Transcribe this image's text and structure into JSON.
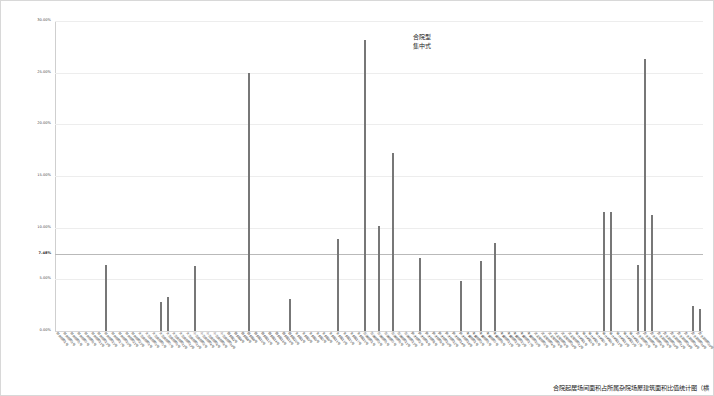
{
  "chart_data": {
    "type": "bar",
    "title": "",
    "xlabel": "",
    "ylabel": "",
    "ylim": [
      0,
      30
    ],
    "grid": true,
    "legend": null,
    "y_ticks": [
      {
        "value": 30,
        "label": "30.00%",
        "bold": false
      },
      {
        "value": 25,
        "label": "25.00%",
        "bold": false
      },
      {
        "value": 20,
        "label": "20.00%",
        "bold": false
      },
      {
        "value": 15,
        "label": "15.00%",
        "bold": false
      },
      {
        "value": 10,
        "label": "10.00%",
        "bold": false
      },
      {
        "value": 7.48,
        "label": "7.48%",
        "bold": true
      },
      {
        "value": 5,
        "label": "5.00%",
        "bold": false
      },
      {
        "value": 0,
        "label": "0.00%",
        "bold": false
      }
    ],
    "reference_line": {
      "value": 7.48,
      "label": "7.48%"
    },
    "annotations": [
      {
        "text_line1": "合院型",
        "text_line2": "集中式",
        "x_index": 40,
        "y": 29.5
      }
    ],
    "categories": [
      "前井胡同1号",
      "前井胡同3号",
      "前井胡同5号",
      "前井胡同7号",
      "前井胡同9号",
      "前井胡同11号",
      "前井胡同13号",
      "前井胡同15号",
      "前井胡同17号",
      "前井胡同19号",
      "前井胡同21号",
      "前井胡同23号",
      "大石虎胡同1号",
      "大石虎胡同3号",
      "大石虎胡同5号",
      "大石虎胡同7号",
      "大石虎胡同9号",
      "大石虎胡同11号",
      "大石虎胡同13号",
      "大石虎胡同15号",
      "小石虎胡同2号",
      "小石虎胡同4号",
      "小石虎胡同6号",
      "小石虎胡同8号",
      "小石虎胡同10号",
      "西斜街2号",
      "西斜街4号",
      "西斜街6号",
      "西斜街8号",
      "西斜街10号",
      "西斜街12号",
      "西斜街14号",
      "西斜街16号",
      "西斜街18号",
      "西斜街20号",
      "东斜街1号",
      "东斜街3号",
      "东斜街5号",
      "东斜街7号",
      "东斜街9号",
      "东斜街11号",
      "东斜街13号",
      "东斜街15号",
      "东斜街17号",
      "东斜街19号",
      "石碑胡同1号",
      "石碑胡同3号",
      "石碑胡同5号",
      "石碑胡同7号",
      "石碑胡同9号",
      "石碑胡同11号",
      "石碑胡同13号",
      "辟才胡同2号",
      "辟才胡同4号",
      "辟才胡同6号",
      "辟才胡同8号",
      "辟才胡同10号",
      "辟才胡同12号",
      "辟才胡同14号",
      "辟才胡同16号",
      "丰盛胡同1号",
      "丰盛胡同3号",
      "丰盛胡同5号",
      "丰盛胡同7号",
      "丰盛胡同9号",
      "丰盛胡同11号",
      "丰盛胡同13号",
      "丰盛胡同15号",
      "丰盛胡同17号",
      "丰盛胡同19号",
      "武定侯胡同2号",
      "武定侯胡同4号",
      "武定侯胡同6号",
      "武定侯胡同8号",
      "武定侯胡同10号",
      "武定侯胡同12号",
      "锦什坊街1号",
      "锦什坊街3号",
      "锦什坊街5号",
      "锦什坊街7号",
      "锦什坊街9号",
      "锦什坊街11号",
      "锦什坊街13号",
      "锦什坊街15号",
      "锦什坊街17号",
      "受水河胡同2号",
      "受水河胡同4号",
      "受水河胡同6号",
      "受水河胡同8号",
      "受水河胡同10号",
      "受水河胡同12号",
      "受水河胡同14号",
      "受水河胡同16号",
      "受水河胡同18号",
      "受水河胡同20号"
    ],
    "values": [
      0,
      0,
      0,
      0,
      0,
      0,
      0,
      6.4,
      0,
      0,
      0,
      0,
      0,
      0,
      0,
      2.85,
      3.3,
      0,
      0,
      0,
      6.25,
      0,
      0,
      0,
      0,
      0,
      0,
      0,
      24.95,
      0,
      0,
      0,
      0,
      0,
      3.05,
      0,
      0,
      0,
      0,
      0,
      0,
      8.95,
      0,
      0,
      0,
      28.2,
      0,
      10.2,
      0,
      17.25,
      0,
      0,
      0,
      7.1,
      0,
      0,
      0,
      0,
      0,
      4.8,
      0,
      0,
      6.8,
      0,
      8.5,
      0,
      0,
      0,
      0,
      0,
      0,
      0,
      0,
      0,
      0,
      0,
      0,
      0,
      0,
      0,
      11.55,
      11.55,
      0,
      0,
      0,
      6.35,
      26.3,
      11.25,
      0,
      0,
      0,
      0,
      0,
      2.4,
      2.1
    ]
  },
  "caption": {
    "text": "合院起居场间面积占所属杂院场屋建筑面积比值统计图（横"
  },
  "y_axis_bold_value": "7.48%",
  "colors": {
    "bar": "#777777",
    "grid": "#ededed",
    "reference_line": "#b9b9b9",
    "text": "#1a1a1a",
    "page_border": "#d8d8d8"
  }
}
